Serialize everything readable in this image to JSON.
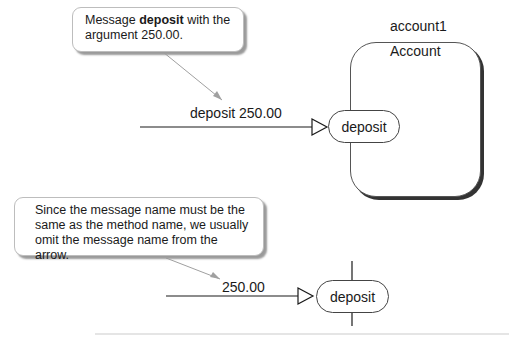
{
  "diagram": {
    "callouts": [
      {
        "prefix": "Message ",
        "bold": "deposit",
        "suffix": " with the argument 250.00."
      },
      {
        "text": "Since the message name must be the same as the method name, we usually omit the message name from the arrow."
      }
    ],
    "object": {
      "name": "account1",
      "class": "Account"
    },
    "messages": [
      {
        "label": "deposit 250.00",
        "method": "deposit"
      },
      {
        "label": "250.00",
        "method": "deposit"
      }
    ],
    "colors": {
      "line": "#1a1a1a",
      "pointer": "#a0a0a0",
      "shadow": "#333333",
      "callout_border": "#bdbdbd"
    }
  }
}
